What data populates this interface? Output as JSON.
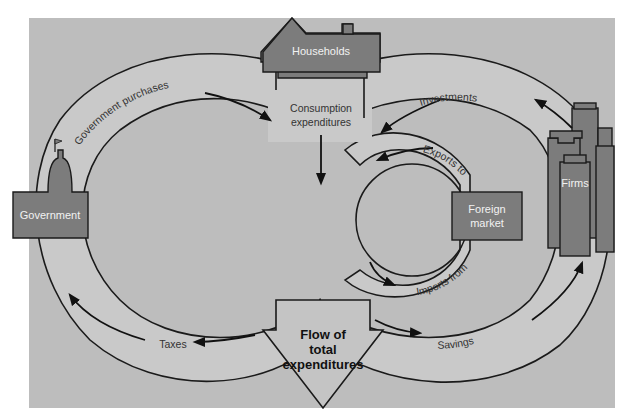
{
  "diagram": {
    "type": "circular-flow",
    "colors": {
      "background": "#bdbdbd",
      "band": "#c9c9c9",
      "entity_fill": "#7c7c7c",
      "outline": "#1a1a1a"
    },
    "entities": {
      "households": "Households",
      "government": "Government",
      "firms": "Firms",
      "foreign_market_line1": "Foreign",
      "foreign_market_line2": "market"
    },
    "flows": {
      "government_purchases": "Government purchases",
      "taxes": "Taxes",
      "consumption_line1": "Consumption",
      "consumption_line2": "expenditures",
      "investments": "Investments",
      "exports_to": "Exports to",
      "imports_from": "Imports from",
      "savings": "Savings"
    },
    "center": {
      "line1": "Flow of",
      "line2": "total",
      "line3": "expenditures"
    }
  }
}
